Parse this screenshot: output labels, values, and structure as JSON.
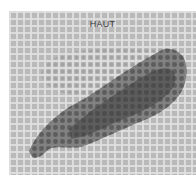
{
  "image": {
    "label": "HAUT",
    "description": "grayscale mesh-textured panel with leaf-shaped dark stain",
    "colors": {
      "panel": "#b9b9b9",
      "grid_lines": "#e1e1e1",
      "light_outline": "#a8a8a8",
      "dark_shape": "#555555",
      "text": "#3a3a3a"
    }
  }
}
